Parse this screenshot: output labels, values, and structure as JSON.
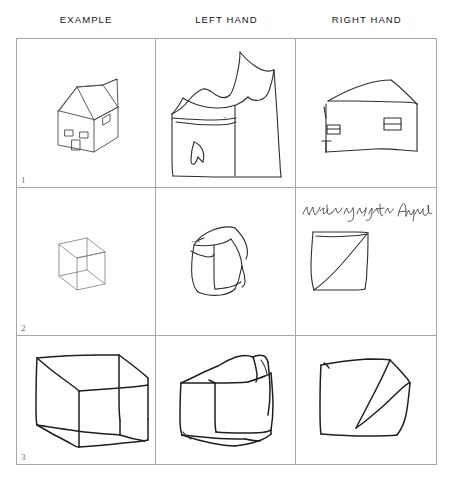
{
  "page": {
    "background_color": "#ffffff",
    "rule_color": "#a8a8a8",
    "ink_color": "#2e2e2e"
  },
  "columns": [
    {
      "id": "example",
      "label": "EXAMPLE"
    },
    {
      "id": "left_hand",
      "label": "LEFT HAND"
    },
    {
      "id": "right_hand",
      "label": "RIGHT HAND"
    }
  ],
  "rows": [
    {
      "number": "1",
      "subject": "house",
      "cells": {
        "example": {
          "figure": "house-3d-example",
          "description": "Three-dimensional house with gable roof, two front windows, a door and one side window"
        },
        "left_hand": {
          "figure": "house-left-hand-copy",
          "description": "Distorted wavering copy of the house, roof collapsed and walls skewed"
        },
        "right_hand": {
          "figure": "house-right-hand-copy",
          "description": "Flattened house outline with low roof, two small windows and a door"
        }
      }
    },
    {
      "number": "2",
      "subject": "cube",
      "cells": {
        "example": {
          "figure": "cube-wireframe-example",
          "description": "Small transparent wireframe cube drawn with straight ruled lines"
        },
        "left_hand": {
          "figure": "cube-left-hand-copy",
          "description": "Rounded wobbly cube copy with uneven edges"
        },
        "right_hand": {
          "figure": "cube-right-hand-copy",
          "description": "Cube reduced to a flat quadrilateral with a single diagonal",
          "annotation": "With my right Hand"
        }
      }
    },
    {
      "number": "3",
      "subject": "large cube",
      "cells": {
        "example": {
          "figure": "large-cube-wireframe-example",
          "description": "Large freehand transparent wireframe cube"
        },
        "left_hand": {
          "figure": "large-cube-left-hand-copy",
          "description": "Large cube copy with shaky doubled lines but intact structure"
        },
        "right_hand": {
          "figure": "large-cube-right-hand-copy",
          "description": "Large cube flattened into a square with two converging diagonals"
        }
      }
    }
  ]
}
